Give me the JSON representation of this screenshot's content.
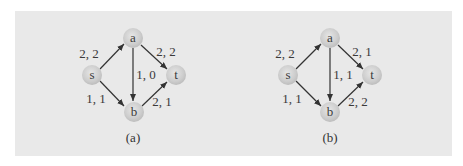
{
  "figure": {
    "background_color": "#e9e9e9",
    "node_color": "#cfcfcf",
    "edge_color": "#333333",
    "panels": [
      {
        "caption": "(a)",
        "nodes": {
          "s": "s",
          "a": "a",
          "b": "b",
          "t": "t"
        },
        "edges": {
          "sa": "2, 2",
          "at": "2, 2",
          "ab": "1, 0",
          "sb": "1, 1",
          "bt": "2, 1"
        }
      },
      {
        "caption": "(b)",
        "nodes": {
          "s": "s",
          "a": "a",
          "b": "b",
          "t": "t"
        },
        "edges": {
          "sa": "2, 2",
          "at": "2, 1",
          "ab": "1, 1",
          "sb": "1, 1",
          "bt": "2, 2"
        }
      }
    ]
  }
}
